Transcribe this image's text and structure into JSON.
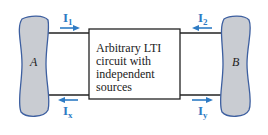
{
  "diagram": {
    "box_text_lines": [
      "Arbitrary LTI",
      "circuit with",
      "independent",
      "sources"
    ],
    "left_network": {
      "label": "A"
    },
    "right_network": {
      "label": "B"
    },
    "currents": {
      "top_left": {
        "main": "I",
        "sub": "1",
        "direction": "right"
      },
      "bottom_left": {
        "main": "I",
        "sub": "x",
        "direction": "left"
      },
      "top_right": {
        "main": "I",
        "sub": "2",
        "direction": "left"
      },
      "bottom_right": {
        "main": "I",
        "sub": "y",
        "direction": "right"
      }
    },
    "colors": {
      "arrow": "#2e7bc4",
      "blob_fill": "#c9ccd2",
      "blob_stroke": "#3d5fa0",
      "wire": "#222222"
    }
  }
}
